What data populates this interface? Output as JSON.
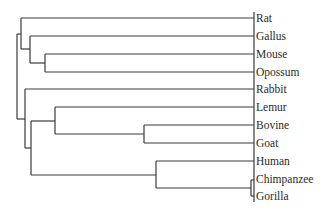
{
  "diagram": {
    "type": "dendrogram",
    "orientation": "left-to-right, leaves on right",
    "line_color": "#3a3a3a",
    "leaves": [
      {
        "label": "Rat",
        "y": 18
      },
      {
        "label": "Gallus",
        "y": 36
      },
      {
        "label": "Mouse",
        "y": 54
      },
      {
        "label": "Opossum",
        "y": 72
      },
      {
        "label": "Rabbit",
        "y": 89
      },
      {
        "label": "Lemur",
        "y": 107
      },
      {
        "label": "Bovine",
        "y": 125
      },
      {
        "label": "Goat",
        "y": 143
      },
      {
        "label": "Human",
        "y": 161
      },
      {
        "label": "Chimpanzee",
        "y": 179
      },
      {
        "label": "Gorilla",
        "y": 196
      }
    ],
    "clusters": [
      "((Rat,(Gallus,(Mouse,Opossum))),(Rabbit,((Lemur,(Bovine,Goat)),(Human,(Chimpanzee,Gorilla)))))"
    ]
  }
}
